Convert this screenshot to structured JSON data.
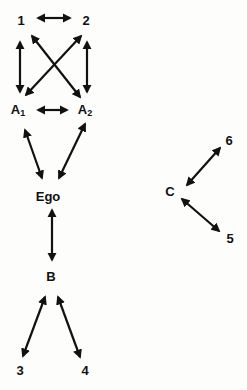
{
  "diagram": {
    "type": "social network / kinship diagram",
    "nodes": [
      {
        "id": "n1",
        "label": "1",
        "x": 21,
        "y": 22
      },
      {
        "id": "n2",
        "label": "2",
        "x": 86,
        "y": 22
      },
      {
        "id": "A1",
        "label": "A",
        "sub": "1",
        "x": 18,
        "y": 111
      },
      {
        "id": "A2",
        "label": "A",
        "sub": "2",
        "x": 85,
        "y": 111
      },
      {
        "id": "Ego",
        "label": "Ego",
        "x": 48,
        "y": 198
      },
      {
        "id": "B",
        "label": "B",
        "x": 51,
        "y": 278
      },
      {
        "id": "n3",
        "label": "3",
        "x": 20,
        "y": 372
      },
      {
        "id": "n4",
        "label": "4",
        "x": 85,
        "y": 372
      },
      {
        "id": "C",
        "label": "C",
        "x": 170,
        "y": 193
      },
      {
        "id": "n6",
        "label": "6",
        "x": 229,
        "y": 142
      },
      {
        "id": "n5",
        "label": "5",
        "x": 230,
        "y": 240
      }
    ],
    "edges": [
      {
        "from": "n1",
        "to": "n2",
        "x1": 38,
        "y1": 18,
        "x2": 70,
        "y2": 18,
        "bidirectional": true
      },
      {
        "from": "n1",
        "to": "A1",
        "x1": 20,
        "y1": 42,
        "x2": 20,
        "y2": 92,
        "bidirectional": true
      },
      {
        "from": "n2",
        "to": "A2",
        "x1": 87,
        "y1": 42,
        "x2": 87,
        "y2": 92,
        "bidirectional": true
      },
      {
        "from": "n1",
        "to": "A2",
        "x1": 32,
        "y1": 36,
        "x2": 80,
        "y2": 97,
        "bidirectional": true
      },
      {
        "from": "n2",
        "to": "A1",
        "x1": 81,
        "y1": 36,
        "x2": 26,
        "y2": 95,
        "bidirectional": true
      },
      {
        "from": "A1",
        "to": "A2",
        "x1": 38,
        "y1": 110,
        "x2": 67,
        "y2": 110,
        "bidirectional": true
      },
      {
        "from": "A1",
        "to": "Ego",
        "x1": 25,
        "y1": 130,
        "x2": 42,
        "y2": 178,
        "bidirectional": true
      },
      {
        "from": "A2",
        "to": "Ego",
        "x1": 85,
        "y1": 124,
        "x2": 59,
        "y2": 178,
        "bidirectional": true
      },
      {
        "from": "Ego",
        "to": "B",
        "x1": 52,
        "y1": 210,
        "x2": 52,
        "y2": 260,
        "bidirectional": true
      },
      {
        "from": "B",
        "to": "n3",
        "x1": 45,
        "y1": 297,
        "x2": 23,
        "y2": 356,
        "bidirectional": true
      },
      {
        "from": "B",
        "to": "n4",
        "x1": 58,
        "y1": 297,
        "x2": 80,
        "y2": 357,
        "bidirectional": true
      },
      {
        "from": "C",
        "to": "n6",
        "x1": 187,
        "y1": 185,
        "x2": 220,
        "y2": 148,
        "bidirectional": true
      },
      {
        "from": "C",
        "to": "n5",
        "x1": 182,
        "y1": 199,
        "x2": 219,
        "y2": 231,
        "bidirectional": true
      }
    ],
    "colors": {
      "ink": "#111111",
      "background": "#fdfdfb"
    }
  }
}
